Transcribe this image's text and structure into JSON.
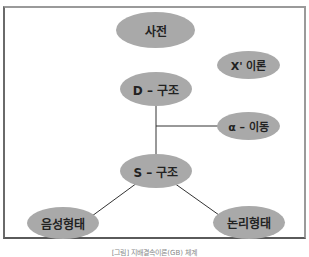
{
  "diagram": {
    "nodes": {
      "lexicon": "사전",
      "xbar": "X' 이론",
      "dstructure": "D – 구조",
      "alpha": "α – 이동",
      "sstructure": "S – 구조",
      "phonetic": "음성형태",
      "logical": "논리형태"
    },
    "caption": "[그림] 지배결속이론(GB) 체계",
    "colors": {
      "node_fill": "#a9a9a9",
      "line": "#333333",
      "border": "#7a7a7a"
    }
  }
}
